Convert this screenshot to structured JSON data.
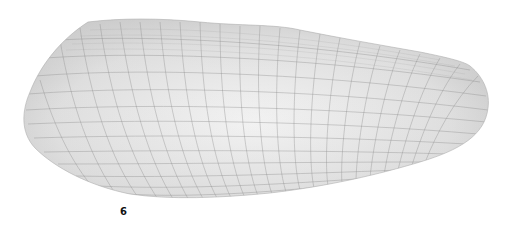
{
  "figure": {
    "label": "6",
    "colors": {
      "background": "#ffffff",
      "surface_light": "#f2f2f2",
      "surface_mid": "#d9d9d9",
      "surface_dark": "#b8b8b8",
      "grid_line": "#8a8a8a"
    }
  }
}
